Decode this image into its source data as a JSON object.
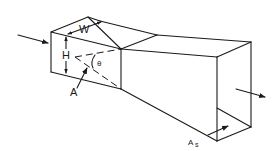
{
  "diagram": {
    "type": "isometric-duct-diffuser",
    "labels": {
      "width": "W",
      "height": "H",
      "angle": "θ",
      "inlet_area": "A",
      "outlet_area_main": "A",
      "outlet_area_sub": "s"
    },
    "flow": {
      "inlet_arrow": "flow-in",
      "outlet_arrow": "flow-out"
    },
    "colors": {
      "line": "#1a1a1a",
      "background": "#ffffff"
    }
  }
}
